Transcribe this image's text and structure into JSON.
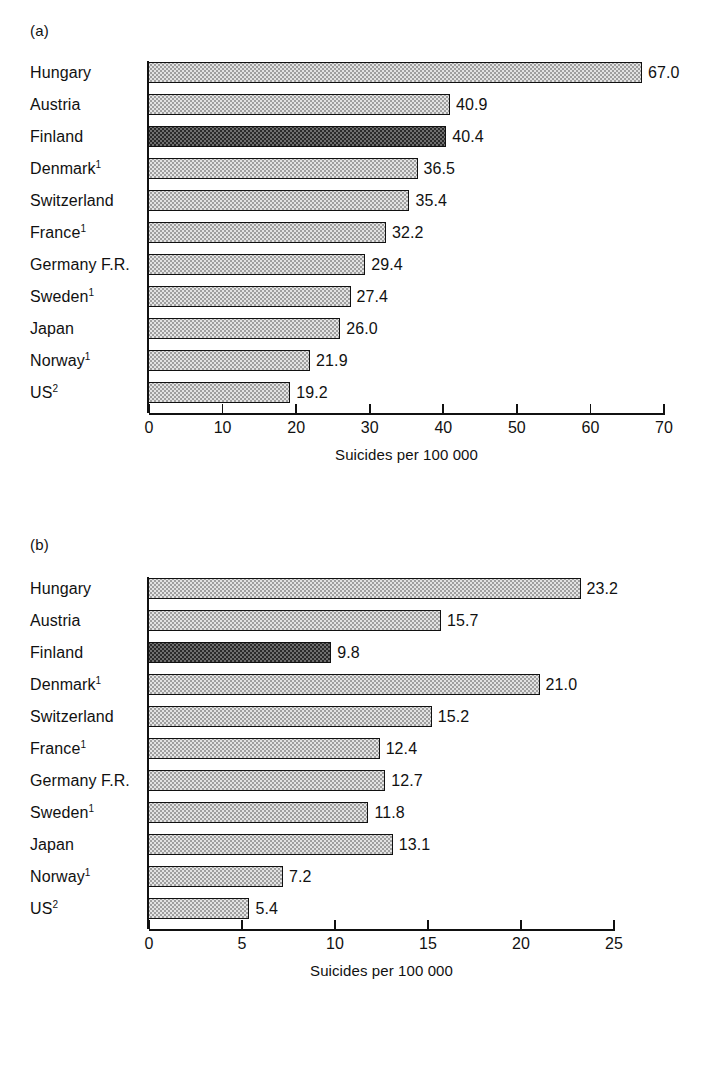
{
  "figure": {
    "panel_a_letter": "(a)",
    "panel_b_letter": "(b)",
    "axis_title": "Suicides per 100 000"
  },
  "chart_data": [
    {
      "type": "bar",
      "orientation": "horizontal",
      "panel": "(a)",
      "title": "",
      "xlabel": "Suicides per 100 000",
      "ylabel": "",
      "xlim": [
        0,
        70
      ],
      "xticks": [
        0,
        10,
        20,
        30,
        40,
        50,
        60,
        70
      ],
      "xtick_labels": [
        "0",
        "10",
        "20",
        "30",
        "40",
        "50",
        "60",
        "70"
      ],
      "grid": false,
      "legend": "none",
      "highlight_category": "Finland",
      "categories": [
        "Hungary",
        "Austria",
        "Finland",
        "Denmark",
        "Switzerland",
        "France",
        "Germany F.R.",
        "Sweden",
        "Japan",
        "Norway",
        "US"
      ],
      "category_footnotes": [
        "",
        "",
        "",
        "1",
        "",
        "1",
        "",
        "1",
        "",
        "1",
        "2"
      ],
      "values": [
        67.0,
        40.9,
        40.4,
        36.5,
        35.4,
        32.2,
        29.4,
        27.4,
        26.0,
        21.9,
        19.2
      ],
      "value_labels": [
        "67.0",
        "40.9",
        "40.4",
        "36.5",
        "35.4",
        "32.2",
        "29.4",
        "27.4",
        "26.0",
        "21.9",
        "19.2"
      ],
      "bar_styles": [
        "light",
        "light",
        "dark",
        "light",
        "light",
        "light",
        "light",
        "light",
        "light",
        "light",
        "light"
      ]
    },
    {
      "type": "bar",
      "orientation": "horizontal",
      "panel": "(b)",
      "title": "",
      "xlabel": "Suicides per 100 000",
      "ylabel": "",
      "xlim": [
        0,
        25
      ],
      "xticks": [
        0,
        5,
        10,
        15,
        20,
        25
      ],
      "xtick_labels": [
        "0",
        "5",
        "10",
        "15",
        "20",
        "25"
      ],
      "grid": false,
      "legend": "none",
      "highlight_category": "Finland",
      "categories": [
        "Hungary",
        "Austria",
        "Finland",
        "Denmark",
        "Switzerland",
        "France",
        "Germany F.R.",
        "Sweden",
        "Japan",
        "Norway",
        "US"
      ],
      "category_footnotes": [
        "",
        "",
        "",
        "1",
        "",
        "1",
        "",
        "1",
        "",
        "1",
        "2"
      ],
      "values": [
        23.2,
        15.7,
        9.8,
        21.0,
        15.2,
        12.4,
        12.7,
        11.8,
        13.1,
        7.2,
        5.4
      ],
      "value_labels": [
        "23.2",
        "15.7",
        "9.8",
        "21.0",
        "15.2",
        "12.4",
        "12.7",
        "11.8",
        "13.1",
        "7.2",
        "5.4"
      ],
      "bar_styles": [
        "light",
        "light",
        "dark",
        "light",
        "light",
        "light",
        "light",
        "light",
        "light",
        "light",
        "light"
      ]
    }
  ]
}
